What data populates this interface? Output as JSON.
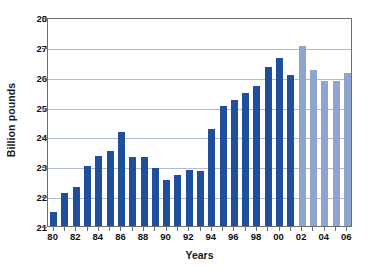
{
  "chart_data": {
    "type": "bar",
    "title": "",
    "xlabel": "Years",
    "ylabel": "Billion pounds",
    "ylim": [
      21,
      28
    ],
    "ytick_values": [
      21,
      22,
      23,
      24,
      25,
      26,
      27,
      28
    ],
    "ytick_labels": [
      "21",
      "22",
      "23",
      "24",
      "25",
      "26",
      "27",
      "28"
    ],
    "grid": true,
    "grid_axis": "y",
    "legend": "none",
    "categories": [
      "80",
      "81",
      "82",
      "83",
      "84",
      "85",
      "86",
      "87",
      "88",
      "89",
      "90",
      "91",
      "92",
      "93",
      "94",
      "95",
      "96",
      "97",
      "98",
      "99",
      "00",
      "01",
      "02",
      "03",
      "04",
      "05",
      "06"
    ],
    "xtick_labels": [
      "80",
      "82",
      "84",
      "86",
      "88",
      "90",
      "92",
      "94",
      "96",
      "98",
      "00",
      "02",
      "04",
      "06"
    ],
    "values": [
      21.55,
      22.18,
      22.37,
      23.08,
      23.4,
      23.58,
      24.2,
      23.37,
      23.39,
      23.0,
      22.6,
      22.77,
      22.95,
      22.92,
      24.3,
      25.08,
      25.3,
      25.52,
      25.75,
      26.38,
      26.7,
      26.12,
      27.1,
      26.28,
      25.92,
      25.93,
      26.18
    ],
    "colors": {
      "primary": "#1F4E9C",
      "secondary": "#8FA5D0",
      "axis": "#6E6E6E",
      "gridline": "#AEBCD6",
      "text": "#101010",
      "background": "#FFFFFF"
    },
    "series_color_by_index": [
      "primary",
      "primary",
      "primary",
      "primary",
      "primary",
      "primary",
      "primary",
      "primary",
      "primary",
      "primary",
      "primary",
      "primary",
      "primary",
      "primary",
      "primary",
      "primary",
      "primary",
      "primary",
      "primary",
      "primary",
      "primary",
      "primary",
      "secondary",
      "secondary",
      "secondary",
      "secondary",
      "secondary"
    ]
  }
}
